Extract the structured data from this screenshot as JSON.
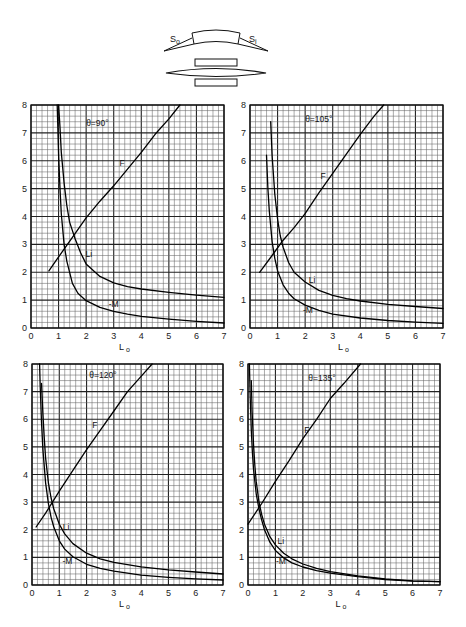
{
  "diagram": {
    "label_object_surface": "S",
    "label_object_sub": "o",
    "label_image_surface": "S",
    "label_image_sub": "i"
  },
  "chart_data": [
    {
      "type": "line",
      "title": "θ=90°",
      "xlabel": "L",
      "xlabel_sub": "o",
      "ylabel": "",
      "xlim": [
        0,
        7
      ],
      "ylim": [
        0,
        8
      ],
      "xticks": [
        "0",
        "1",
        "2",
        "3",
        "4",
        "5",
        "6",
        "7"
      ],
      "yticks": [
        "0",
        "1",
        "2",
        "3",
        "4",
        "5",
        "6",
        "7",
        "8"
      ],
      "grid": true,
      "grid_minor_per_unit": 5,
      "series": [
        {
          "name": "F",
          "label": "F",
          "x": [
            0.65,
            1.0,
            1.5,
            2.0,
            2.5,
            3.0,
            3.5,
            4.0,
            4.5,
            5.0,
            5.4
          ],
          "y": [
            2.05,
            2.55,
            3.25,
            3.95,
            4.55,
            5.1,
            5.7,
            6.3,
            6.95,
            7.5,
            8.0
          ]
        },
        {
          "name": "Li",
          "label": "Li",
          "x": [
            1.0,
            1.05,
            1.1,
            1.2,
            1.3,
            1.4,
            1.6,
            1.8,
            2.0,
            2.5,
            3.0,
            3.5,
            4.0,
            5.0,
            6.0,
            7.0
          ],
          "y": [
            8.0,
            7.2,
            6.3,
            5.2,
            4.4,
            3.8,
            3.2,
            2.7,
            2.3,
            1.85,
            1.62,
            1.48,
            1.4,
            1.28,
            1.18,
            1.1
          ]
        },
        {
          "name": "-M",
          "label": "-M",
          "x": [
            0.95,
            1.0,
            1.05,
            1.1,
            1.2,
            1.3,
            1.5,
            1.7,
            2.0,
            2.5,
            3.0,
            3.5,
            4.0,
            5.0,
            6.0,
            7.0
          ],
          "y": [
            8.0,
            6.2,
            5.0,
            4.1,
            3.0,
            2.4,
            1.6,
            1.25,
            0.98,
            0.74,
            0.6,
            0.5,
            0.42,
            0.32,
            0.24,
            0.18
          ]
        }
      ],
      "annotations": [
        {
          "text": "θ=90°",
          "x": 2.0,
          "y": 7.25
        },
        {
          "text": "F",
          "x": 3.3,
          "y": 5.8
        },
        {
          "text": "Li",
          "x": 2.1,
          "y": 2.55
        },
        {
          "text": "-M",
          "x": 3.0,
          "y": 0.75
        }
      ]
    },
    {
      "type": "line",
      "title": "θ=105°",
      "xlabel": "L",
      "xlabel_sub": "o",
      "ylabel": "",
      "xlim": [
        0,
        7
      ],
      "ylim": [
        0,
        8
      ],
      "xticks": [
        "0",
        "1",
        "2",
        "3",
        "4",
        "5",
        "6",
        "7"
      ],
      "yticks": [
        "0",
        "1",
        "2",
        "3",
        "4",
        "5",
        "6",
        "7",
        "8"
      ],
      "grid": true,
      "grid_minor_per_unit": 5,
      "series": [
        {
          "name": "F",
          "label": "F",
          "x": [
            0.35,
            0.8,
            1.2,
            1.6,
            2.0,
            2.5,
            3.0,
            3.5,
            4.0,
            4.5,
            4.85
          ],
          "y": [
            2.0,
            2.6,
            3.15,
            3.6,
            4.1,
            4.85,
            5.55,
            6.25,
            6.95,
            7.6,
            8.0
          ]
        },
        {
          "name": "Li",
          "label": "Li",
          "x": [
            0.75,
            0.8,
            0.9,
            1.0,
            1.1,
            1.2,
            1.4,
            1.6,
            2.0,
            2.5,
            3.0,
            3.5,
            4.0,
            5.0,
            6.0,
            7.0
          ],
          "y": [
            7.4,
            6.2,
            4.8,
            3.9,
            3.3,
            2.9,
            2.35,
            2.0,
            1.65,
            1.35,
            1.17,
            1.05,
            0.97,
            0.85,
            0.77,
            0.7
          ]
        },
        {
          "name": "-M",
          "label": "-M",
          "x": [
            0.6,
            0.65,
            0.7,
            0.8,
            0.9,
            1.0,
            1.2,
            1.4,
            1.6,
            2.0,
            2.5,
            3.0,
            4.0,
            5.0,
            6.0,
            7.0
          ],
          "y": [
            6.2,
            5.0,
            4.2,
            3.1,
            2.5,
            2.05,
            1.55,
            1.25,
            1.05,
            0.82,
            0.63,
            0.5,
            0.36,
            0.27,
            0.21,
            0.17
          ]
        }
      ],
      "annotations": [
        {
          "text": "θ=105°",
          "x": 2.0,
          "y": 7.4
        },
        {
          "text": "F",
          "x": 2.65,
          "y": 5.35
        },
        {
          "text": "Li",
          "x": 2.25,
          "y": 1.6
        },
        {
          "text": "-M",
          "x": 2.1,
          "y": 0.55
        }
      ]
    },
    {
      "type": "line",
      "title": "θ=120°",
      "xlabel": "L",
      "xlabel_sub": "o",
      "ylabel": "",
      "xlim": [
        0,
        7
      ],
      "ylim": [
        0,
        8
      ],
      "xticks": [
        "0",
        "1",
        "2",
        "3",
        "4",
        "5",
        "6",
        "7"
      ],
      "yticks": [
        "0",
        "1",
        "2",
        "3",
        "4",
        "5",
        "6",
        "7",
        "8"
      ],
      "grid": true,
      "grid_minor_per_unit": 5,
      "series": [
        {
          "name": "F",
          "label": "F",
          "x": [
            0.15,
            0.5,
            1.0,
            1.5,
            2.0,
            2.5,
            3.0,
            3.5,
            4.0,
            4.4
          ],
          "y": [
            2.1,
            2.6,
            3.4,
            4.15,
            4.9,
            5.6,
            6.3,
            7.0,
            7.55,
            8.0
          ]
        },
        {
          "name": "Li",
          "label": "Li",
          "x": [
            0.35,
            0.4,
            0.45,
            0.5,
            0.6,
            0.7,
            0.8,
            1.0,
            1.2,
            1.5,
            2.0,
            2.5,
            3.0,
            4.0,
            5.0,
            6.0,
            7.0
          ],
          "y": [
            7.3,
            6.2,
            5.3,
            4.6,
            3.7,
            3.15,
            2.75,
            2.2,
            1.85,
            1.5,
            1.15,
            0.95,
            0.82,
            0.66,
            0.55,
            0.47,
            0.4
          ]
        },
        {
          "name": "-M",
          "label": "-M",
          "x": [
            0.28,
            0.3,
            0.35,
            0.4,
            0.5,
            0.6,
            0.7,
            0.8,
            1.0,
            1.2,
            1.5,
            2.0,
            2.5,
            3.0,
            4.0,
            5.0,
            6.0,
            7.0
          ],
          "y": [
            8.0,
            7.2,
            5.9,
            4.9,
            3.7,
            2.95,
            2.45,
            2.1,
            1.6,
            1.3,
            1.02,
            0.75,
            0.6,
            0.5,
            0.36,
            0.28,
            0.22,
            0.18
          ]
        }
      ],
      "annotations": [
        {
          "text": "θ=120°",
          "x": 2.1,
          "y": 7.5
        },
        {
          "text": "F",
          "x": 2.3,
          "y": 5.7
        },
        {
          "text": "Li",
          "x": 1.25,
          "y": 2.0
        },
        {
          "text": "-M",
          "x": 1.3,
          "y": 0.75
        }
      ]
    },
    {
      "type": "line",
      "title": "θ=135°",
      "xlabel": "L",
      "xlabel_sub": "o",
      "ylabel": "",
      "xlim": [
        0,
        7
      ],
      "ylim": [
        0,
        8
      ],
      "xticks": [
        "0",
        "1",
        "2",
        "3",
        "4",
        "5",
        "6",
        "7"
      ],
      "yticks": [
        "0",
        "1",
        "2",
        "3",
        "4",
        "5",
        "6",
        "7",
        "8"
      ],
      "grid": true,
      "grid_minor_per_unit": 5,
      "series": [
        {
          "name": "F",
          "label": "F",
          "x": [
            0.0,
            0.5,
            1.0,
            1.5,
            2.0,
            2.5,
            3.0,
            3.5,
            4.1
          ],
          "y": [
            2.2,
            2.95,
            3.75,
            4.5,
            5.3,
            6.0,
            6.75,
            7.3,
            8.0
          ]
        },
        {
          "name": "Li",
          "label": "Li",
          "x": [
            0.12,
            0.15,
            0.2,
            0.25,
            0.3,
            0.4,
            0.5,
            0.6,
            0.8,
            1.0,
            1.3,
            1.6,
            2.0,
            2.5,
            3.0,
            4.0,
            5.0,
            6.0,
            7.0
          ],
          "y": [
            7.4,
            6.3,
            5.1,
            4.3,
            3.75,
            3.0,
            2.55,
            2.2,
            1.75,
            1.45,
            1.15,
            0.95,
            0.76,
            0.6,
            0.48,
            0.33,
            0.22,
            0.15,
            0.12
          ]
        },
        {
          "name": "-M",
          "label": "-M",
          "x": [
            0.05,
            0.08,
            0.12,
            0.16,
            0.2,
            0.3,
            0.4,
            0.5,
            0.6,
            0.8,
            1.0,
            1.3,
            1.6,
            2.0,
            2.5,
            3.0,
            4.0,
            5.0,
            6.0,
            7.0
          ],
          "y": [
            8.0,
            6.8,
            5.6,
            4.8,
            4.2,
            3.3,
            2.75,
            2.35,
            2.0,
            1.55,
            1.25,
            0.98,
            0.8,
            0.65,
            0.52,
            0.43,
            0.3,
            0.2,
            0.14,
            0.12
          ]
        }
      ],
      "annotations": [
        {
          "text": "θ=135°",
          "x": 2.2,
          "y": 7.4
        },
        {
          "text": "F",
          "x": 2.15,
          "y": 5.5
        },
        {
          "text": "Li",
          "x": 1.2,
          "y": 1.5
        },
        {
          "text": "-M",
          "x": 1.2,
          "y": 0.75
        }
      ]
    }
  ]
}
